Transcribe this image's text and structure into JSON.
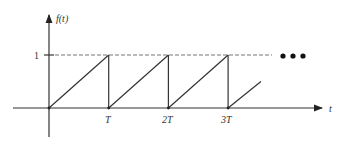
{
  "chart_data": {
    "type": "line",
    "title": "",
    "xlabel": "t",
    "ylabel": "f(t)",
    "x_ticks": [
      "T",
      "2T",
      "3T"
    ],
    "y_ticks": [
      "1"
    ],
    "xlim": [
      0,
      4.6
    ],
    "ylim": [
      0,
      1
    ],
    "series": [
      {
        "name": "sawtooth",
        "points": [
          [
            0,
            0
          ],
          [
            1,
            1
          ],
          [
            1,
            0
          ],
          [
            2,
            1
          ],
          [
            2,
            0
          ],
          [
            3,
            1
          ],
          [
            3,
            0
          ],
          [
            3.55,
            0.5
          ]
        ]
      }
    ],
    "reference_line": {
      "y": 1,
      "style": "dashed"
    },
    "continuation": "•••"
  }
}
